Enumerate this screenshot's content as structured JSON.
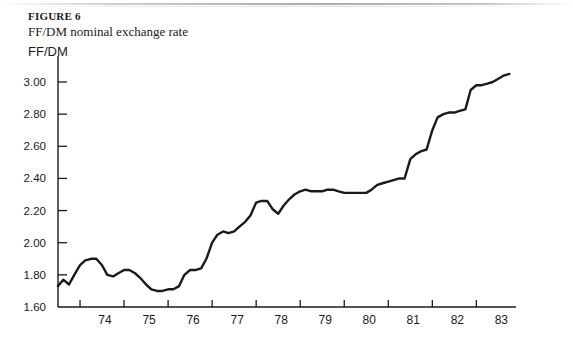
{
  "figure": {
    "label": "FIGURE 6",
    "subtitle": "FF/DM nominal exchange rate",
    "axis_unit": "FF/DM"
  },
  "chart_data": {
    "type": "line",
    "title": "FF/DM nominal exchange rate",
    "xlabel": "",
    "ylabel": "FF/DM",
    "grid": false,
    "legend": null,
    "line_color": "#1a1a1a",
    "axis_color": "#1a1a1a",
    "xlim": [
      1973.5,
      1983.9
    ],
    "ylim": [
      1.6,
      3.1
    ],
    "yticks": [
      "1.60",
      "1.80",
      "2.00",
      "2.20",
      "2.40",
      "2.60",
      "2.80",
      "3.00"
    ],
    "ytick_values": [
      1.6,
      1.8,
      2.0,
      2.2,
      2.4,
      2.6,
      2.8,
      3.0
    ],
    "xticks": [
      "74",
      "75",
      "76",
      "77",
      "78",
      "79",
      "80",
      "81",
      "82",
      "83"
    ],
    "xtick_values": [
      1974,
      1975,
      1976,
      1977,
      1978,
      1979,
      1980,
      1981,
      1982,
      1983
    ],
    "x": [
      1973.5,
      1973.62,
      1973.75,
      1973.87,
      1974.0,
      1974.12,
      1974.25,
      1974.37,
      1974.5,
      1974.62,
      1974.75,
      1974.87,
      1975.0,
      1975.12,
      1975.25,
      1975.37,
      1975.5,
      1975.62,
      1975.75,
      1975.87,
      1976.0,
      1976.12,
      1976.25,
      1976.37,
      1976.5,
      1976.62,
      1976.75,
      1976.87,
      1977.0,
      1977.12,
      1977.25,
      1977.37,
      1977.5,
      1977.62,
      1977.75,
      1977.87,
      1978.0,
      1978.12,
      1978.25,
      1978.37,
      1978.5,
      1978.62,
      1978.75,
      1978.87,
      1979.0,
      1979.12,
      1979.25,
      1979.37,
      1979.5,
      1979.62,
      1979.75,
      1979.87,
      1980.0,
      1980.12,
      1980.25,
      1980.37,
      1980.5,
      1980.62,
      1980.75,
      1980.87,
      1981.0,
      1981.12,
      1981.25,
      1981.37,
      1981.5,
      1981.62,
      1981.75,
      1981.87,
      1982.0,
      1982.12,
      1982.25,
      1982.37,
      1982.5,
      1982.62,
      1982.75,
      1982.87,
      1983.0,
      1983.12,
      1983.25,
      1983.37,
      1983.5,
      1983.62,
      1983.75
    ],
    "values": [
      1.73,
      1.77,
      1.74,
      1.8,
      1.86,
      1.89,
      1.9,
      1.9,
      1.86,
      1.8,
      1.79,
      1.81,
      1.83,
      1.83,
      1.81,
      1.78,
      1.74,
      1.71,
      1.7,
      1.7,
      1.71,
      1.71,
      1.73,
      1.8,
      1.83,
      1.83,
      1.84,
      1.9,
      2.0,
      2.05,
      2.07,
      2.06,
      2.07,
      2.1,
      2.13,
      2.17,
      2.25,
      2.26,
      2.26,
      2.21,
      2.18,
      2.23,
      2.27,
      2.3,
      2.32,
      2.33,
      2.32,
      2.32,
      2.32,
      2.33,
      2.33,
      2.32,
      2.31,
      2.31,
      2.31,
      2.31,
      2.31,
      2.33,
      2.36,
      2.37,
      2.38,
      2.39,
      2.4,
      2.4,
      2.52,
      2.55,
      2.57,
      2.58,
      2.7,
      2.78,
      2.8,
      2.81,
      2.81,
      2.82,
      2.83,
      2.95,
      2.98,
      2.98,
      2.99,
      3.0,
      3.02,
      3.04,
      3.05
    ]
  }
}
